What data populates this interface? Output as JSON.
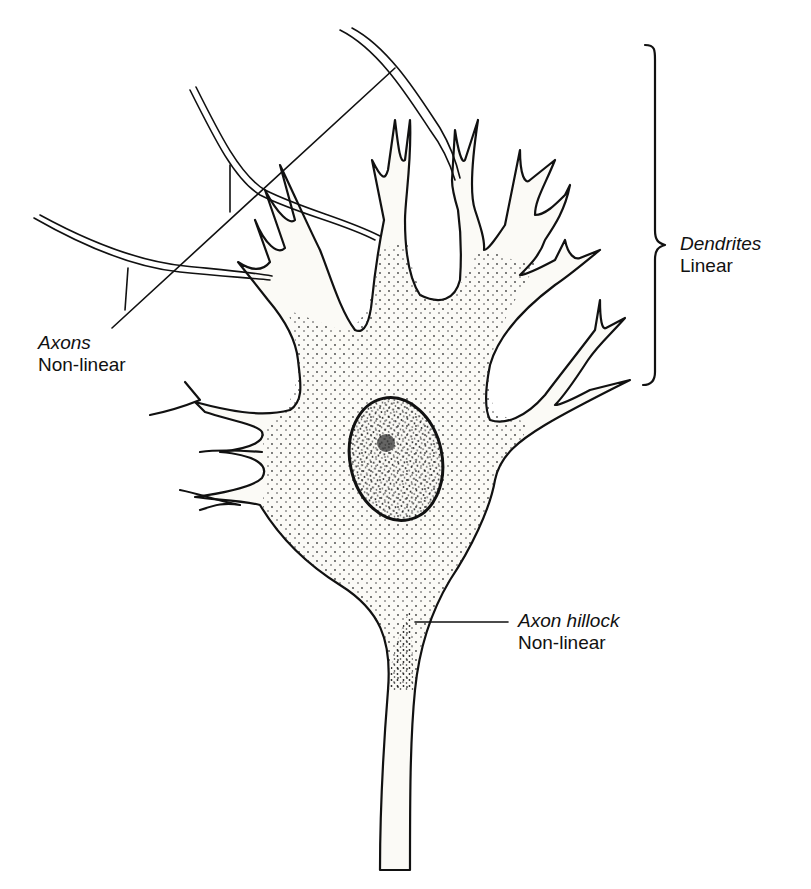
{
  "diagram": {
    "labels": {
      "dendrites": {
        "name": "Dendrites",
        "property": "Linear"
      },
      "axons": {
        "name": "Axons",
        "property": "Non-linear"
      },
      "axon_hillock": {
        "name": "Axon hillock",
        "property": "Non-linear"
      }
    },
    "parts": [
      "dendrites",
      "incoming axons",
      "cell body",
      "nucleus",
      "nucleolus",
      "axon hillock",
      "axon"
    ],
    "colors": {
      "ink": "#111111",
      "background": "#ffffff",
      "stipple": "#222222"
    }
  }
}
